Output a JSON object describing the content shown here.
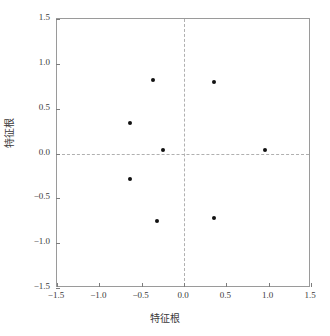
{
  "chart_data": {
    "type": "scatter",
    "title": "",
    "xlabel": "特征根",
    "ylabel": "特征根",
    "xlim": [
      -1.5,
      1.5
    ],
    "ylim": [
      -1.5,
      1.5
    ],
    "grid": false,
    "legend": null,
    "reference_lines": {
      "vertical_x": 0.0,
      "horizontal_y": 0.0,
      "style": "dashed",
      "color": "#b0b0b0"
    },
    "xticks": [
      "-1.5",
      "-1.0",
      "-0.5",
      "0.0",
      "0.5",
      "1.0",
      "1.5"
    ],
    "xtick_values": [
      -1.5,
      -1.0,
      -0.5,
      0.0,
      0.5,
      1.0,
      1.5
    ],
    "yticks": [
      "1.5",
      "1.0",
      "0.5",
      "0.0",
      "-0.5",
      "-1.0",
      "-1.5"
    ],
    "ytick_values": [
      1.5,
      1.0,
      0.5,
      0.0,
      -0.5,
      -1.0,
      -1.5
    ],
    "marker": {
      "shape": "circle",
      "color": "#111111",
      "size_px": 4
    },
    "points": [
      {
        "x": -0.37,
        "y": 0.82
      },
      {
        "x": 0.35,
        "y": 0.8
      },
      {
        "x": -0.64,
        "y": 0.34
      },
      {
        "x": -0.25,
        "y": 0.04
      },
      {
        "x": 0.96,
        "y": 0.04
      },
      {
        "x": -0.64,
        "y": -0.28
      },
      {
        "x": -0.32,
        "y": -0.75
      },
      {
        "x": 0.35,
        "y": -0.72
      }
    ]
  }
}
